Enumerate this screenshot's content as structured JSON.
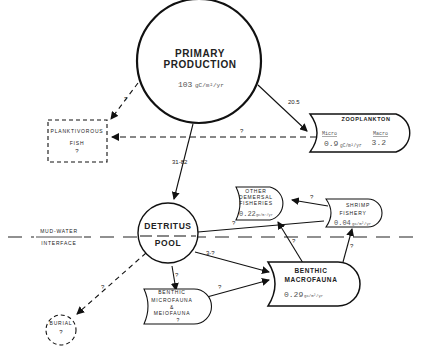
{
  "nodes": {
    "primary_production": {
      "title_line1": "PRIMARY",
      "title_line2": "PRODUCTION",
      "value": "103",
      "unit": "gC/m²/yr"
    },
    "zooplankton": {
      "title": "ZOOPLANKTON",
      "micro_label": "Micro",
      "macro_label": "Macro",
      "micro_value": "0.9",
      "macro_value": "3.2",
      "unit": "gC/m²/yr"
    },
    "planktivorous_fish": {
      "line1": "PLANKTIVOROUS",
      "line2": "FISH",
      "value": "?"
    },
    "detritus_pool": {
      "line1": "DETRITUS",
      "line2": "POOL"
    },
    "other_demersal": {
      "line1": "OTHER",
      "line2": "DEMERSAL",
      "line3": "FISHERIES",
      "value": "0.22",
      "unit": "gC/m²/yr"
    },
    "shrimp_fishery": {
      "line1": "SHRIMP",
      "line2": "FISHERY",
      "value": "0.04",
      "unit": "gC/m²/yr"
    },
    "benthic_macrofauna": {
      "line1": "BENTHIC",
      "line2": "MACROFAUNA",
      "value": "0.29",
      "unit": "gC/m²/yr"
    },
    "benthic_microfauna": {
      "line1": "BENTHIC",
      "line2": "MICROFAUNA",
      "line3": "&",
      "line4": "MEIOFAUNA",
      "value": "?"
    },
    "burial": {
      "line1": "BURIAL",
      "value": "?"
    }
  },
  "interface": {
    "line1": "MUD-WATER",
    "line2": "INTERFACE"
  },
  "flows": {
    "pp_to_zoo": "20.5",
    "pp_to_detritus": "31-82",
    "pp_to_fish": "?",
    "zoo_to_fish": "?",
    "detritus_to_shrimp": "?",
    "detritus_to_macro": "3-?",
    "detritus_to_micro": "?",
    "detritus_to_burial": "?",
    "micro_to_macro": "?",
    "macro_to_demersal": "?",
    "macro_to_shrimp": "?",
    "shrimp_to_demersal": "?"
  }
}
